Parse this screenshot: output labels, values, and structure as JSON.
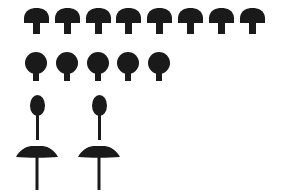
{
  "figure": {
    "background_color": "#ffffff",
    "fill_color": "#1a1a1a",
    "width": 282,
    "height": 193
  },
  "chart_data": {
    "type": "bar",
    "subtitle": "",
    "xlabel": "",
    "ylabel": "",
    "orientation": "horizontal",
    "unit": "1 icon = 1 count",
    "categories": [
      "Domed cap",
      "Round cap",
      "Oval cap",
      "Flat cap"
    ],
    "values": [
      8,
      5,
      2,
      2
    ],
    "ylim": [
      0,
      8
    ],
    "grid": false,
    "legend": false,
    "legend_position": "none",
    "tick_labels": [],
    "annotations": []
  },
  "rows": [
    {
      "name": "domed-cap-row",
      "shape": "domed-cap-mushroom",
      "count": 8,
      "icon_label": "mushroom-domed-icon",
      "start_x": 24,
      "pitch": 30.8,
      "cap_width": 25,
      "cap_height": 15,
      "stem_width": 7,
      "stem_height": 11
    },
    {
      "name": "round-cap-row",
      "shape": "round-cap-mushroom",
      "count": 5,
      "icon_label": "mushroom-round-icon",
      "start_x": 25,
      "pitch": 30.8,
      "cap_width": 22,
      "cap_height": 22,
      "stem_width": 6,
      "stem_height": 7
    },
    {
      "name": "oval-cap-row",
      "shape": "oval-cap-mushroom",
      "count": 2,
      "icon_label": "mushroom-oval-icon",
      "start_x": 30,
      "pitch": 62,
      "cap_width": 15,
      "cap_height": 21,
      "stem_width": 3,
      "stem_height": 24
    },
    {
      "name": "flat-cap-row",
      "shape": "flat-cap-mushroom",
      "count": 2,
      "icon_label": "mushroom-flat-icon",
      "start_x": 16,
      "pitch": 62,
      "cap_width": 42,
      "cap_height": 12,
      "stem_width": 3,
      "stem_height": 32
    }
  ]
}
